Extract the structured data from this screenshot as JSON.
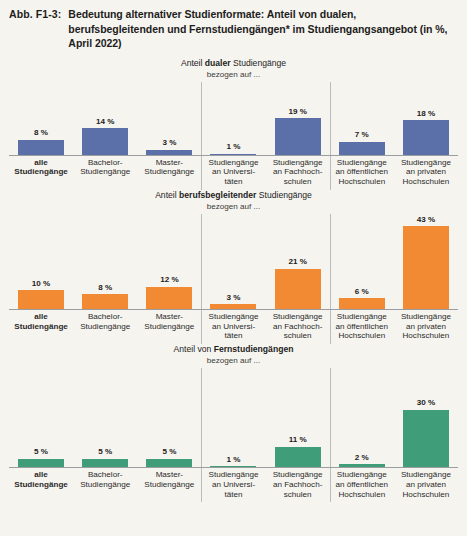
{
  "figure": {
    "number": "Abb. F1-3:",
    "title": "Bedeutung alternativer Studienformate: Anteil von dualen, berufsbegleitenden und Fernstudiengängen* im Studiengangsangebot (in %, April 2022)"
  },
  "colors": {
    "blue": "#5b6fa8",
    "orange": "#f18a33",
    "green": "#3f9e79",
    "background": "#f6f4ef",
    "axis": "#9a9da2",
    "separator": "#b9bcc0",
    "text": "#1d1d1d"
  },
  "categories": [
    "alle Studiengänge",
    "Bachelor-Studiengänge",
    "Master-Studiengänge",
    "Studiengänge an Universitäten",
    "Studiengänge an Fachhochschulen",
    "Studiengänge an öffentlichen Hochschulen",
    "Studiengänge an privaten Hochschulen"
  ],
  "category_lines": [
    [
      "alle",
      "Studiengänge"
    ],
    [
      "Bachelor-",
      "Studiengänge"
    ],
    [
      "Master-",
      "Studiengänge"
    ],
    [
      "Studiengänge",
      "an Universi-",
      "täten"
    ],
    [
      "Studiengänge",
      "an Fachhoch-",
      "schulen"
    ],
    [
      "Studiengänge",
      "an öffentlichen",
      "Hochschulen"
    ],
    [
      "Studiengänge",
      "an privaten",
      "Hochschulen"
    ]
  ],
  "panels": [
    {
      "title_prefix": "Anteil ",
      "title_strong": "dualer",
      "title_suffix": " Studiengänge",
      "subtitle": "bezogen auf ...",
      "color_key": "blue",
      "values": [
        8,
        14,
        3,
        1,
        19,
        7,
        18
      ],
      "value_labels": [
        "8 %",
        "14 %",
        "3 %",
        "1 %",
        "19 %",
        "7 %",
        "18 %"
      ]
    },
    {
      "title_prefix": "Anteil ",
      "title_strong": "berufsbegleitender",
      "title_suffix": " Studiengänge",
      "subtitle": "bezogen auf ...",
      "color_key": "orange",
      "values": [
        10,
        8,
        12,
        3,
        21,
        6,
        43
      ],
      "value_labels": [
        "10 %",
        "8 %",
        "12 %",
        "3 %",
        "21 %",
        "6 %",
        "43 %"
      ]
    },
    {
      "title_prefix": "Anteil von ",
      "title_strong": "Fernstudiengängen",
      "title_suffix": "",
      "subtitle": "bezogen auf ...",
      "color_key": "green",
      "values": [
        5,
        5,
        5,
        1,
        11,
        2,
        30
      ],
      "value_labels": [
        "5 %",
        "5 %",
        "5 %",
        "1 %",
        "11 %",
        "2 %",
        "30 %"
      ]
    }
  ],
  "chart_data": {
    "type": "bar",
    "title": "Bedeutung alternativer Studienformate: Anteil von dualen, berufsbegleitenden und Fernstudiengängen* im Studiengangsangebot (in %, April 2022)",
    "xlabel": "",
    "ylabel": "Anteil in %",
    "ylim": [
      0,
      43
    ],
    "grid": false,
    "legend_position": "none",
    "categories": [
      "alle Studiengänge",
      "Bachelor-Studiengänge",
      "Master-Studiengänge",
      "Studiengänge an Universitäten",
      "Studiengänge an Fachhochschulen",
      "Studiengänge an öffentlichen Hochschulen",
      "Studiengänge an privaten Hochschulen"
    ],
    "series": [
      {
        "name": "Anteil dualer Studiengänge",
        "color": "#5b6fa8",
        "values": [
          8,
          14,
          3,
          1,
          19,
          7,
          18
        ]
      },
      {
        "name": "Anteil berufsbegleitender Studiengänge",
        "color": "#f18a33",
        "values": [
          10,
          8,
          12,
          3,
          21,
          6,
          43
        ]
      },
      {
        "name": "Anteil von Fernstudiengängen",
        "color": "#3f9e79",
        "values": [
          5,
          5,
          5,
          1,
          11,
          2,
          30
        ]
      }
    ],
    "annotations": [
      "bezogen auf ...",
      "Werte in Prozent, Stand April 2022"
    ]
  }
}
